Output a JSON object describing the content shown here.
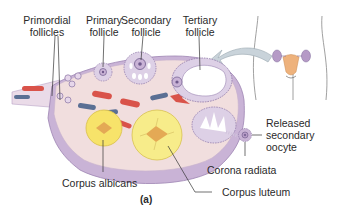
{
  "figure": {
    "panel_label": "(a)",
    "labels": {
      "primordial_follicles": [
        "Primordial",
        "follicles"
      ],
      "primary_follicle": [
        "Primary",
        "follicle"
      ],
      "secondary_follicle": [
        "Secondary",
        "follicle"
      ],
      "tertiary_follicle": [
        "Tertiary",
        "follicle"
      ],
      "released_secondary_oocyte": [
        "Released",
        "secondary",
        "oocyte"
      ],
      "corona_radiata": "Corona radiata",
      "corpus_luteum": "Corpus luteum",
      "corpus_albicans": "Corpus albicans"
    },
    "colors": {
      "ovary_stroma": "#f1dede",
      "ovary_capsule": "#c9b3d6",
      "follicle_purple": "#b59ac6",
      "corpus_yellow": "#f7e36a",
      "vessel_red": "#d9534a",
      "vessel_blue": "#5a6f94",
      "arrow_gray": "#c9d3da",
      "uterus_orange": "#eeb27c"
    }
  }
}
